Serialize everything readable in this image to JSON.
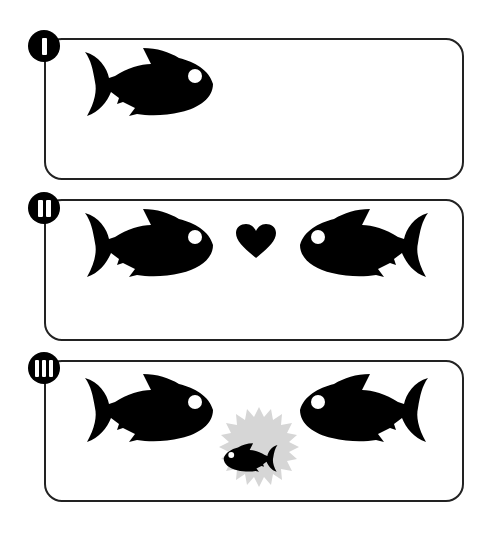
{
  "colors": {
    "fish": "#000000",
    "outline": "#222222",
    "burst": "#d6d6d6",
    "eye": "#ffffff"
  },
  "panels": [
    {
      "stage": "I",
      "bars": 1,
      "content": [
        "fish-right"
      ]
    },
    {
      "stage": "II",
      "bars": 2,
      "content": [
        "fish-right",
        "heart",
        "fish-left"
      ]
    },
    {
      "stage": "III",
      "bars": 3,
      "content": [
        "fish-right",
        "baby-fish-burst",
        "fish-left"
      ]
    }
  ]
}
